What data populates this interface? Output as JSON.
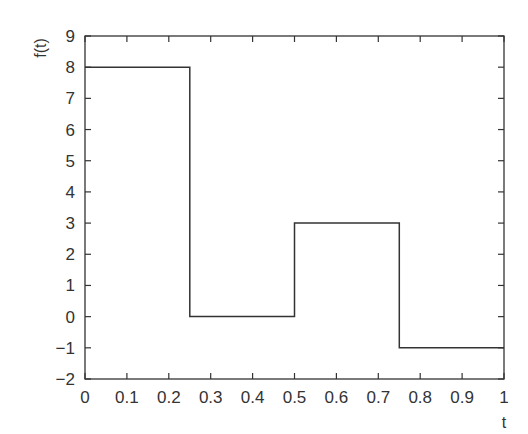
{
  "chart_data": {
    "type": "line",
    "subtype": "step",
    "title": "",
    "xlabel": "t",
    "ylabel": "f(t)",
    "xlim": [
      0,
      1
    ],
    "ylim": [
      -2,
      9
    ],
    "xticks": [
      0,
      0.1,
      0.2,
      0.3,
      0.4,
      0.5,
      0.6,
      0.7,
      0.8,
      0.9,
      1
    ],
    "xtick_labels": [
      "0",
      "0.1",
      "0.2",
      "0.3",
      "0.4",
      "0.5",
      "0.6",
      "0.7",
      "0.8",
      "0.9",
      "1"
    ],
    "yticks": [
      -2,
      -1,
      0,
      1,
      2,
      3,
      4,
      5,
      6,
      7,
      8,
      9
    ],
    "ytick_labels": [
      "−2",
      "−1",
      "0",
      "1",
      "2",
      "3",
      "4",
      "5",
      "6",
      "7",
      "8",
      "9"
    ],
    "grid": false,
    "legend": null,
    "series": [
      {
        "name": "f(t)",
        "color": "#333333",
        "x": [
          0,
          0.25,
          0.25,
          0.5,
          0.5,
          0.75,
          0.75,
          1
        ],
        "y": [
          8,
          8,
          0,
          0,
          3,
          3,
          -1,
          -1
        ]
      }
    ],
    "segments": [
      {
        "t_start": 0,
        "t_end": 0.25,
        "value": 8
      },
      {
        "t_start": 0.25,
        "t_end": 0.5,
        "value": 0
      },
      {
        "t_start": 0.5,
        "t_end": 0.75,
        "value": 3
      },
      {
        "t_start": 0.75,
        "t_end": 1,
        "value": -1
      }
    ]
  },
  "colors": {
    "axis": "#333333",
    "line": "#333333",
    "background": "#ffffff"
  }
}
